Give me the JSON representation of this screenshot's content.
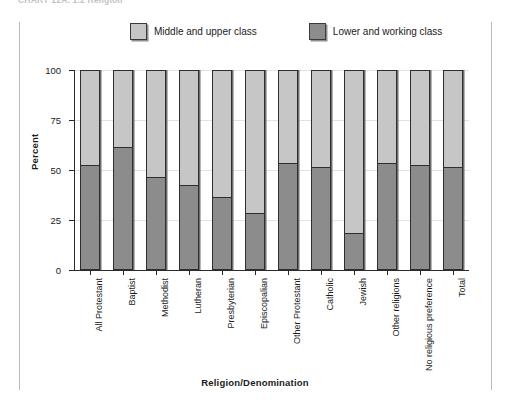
{
  "caption": "CHART 12A.  1.2  Religion",
  "legend": {
    "position": "top",
    "entries": [
      {
        "label": "Middle and upper class",
        "color": "#c6c6c6",
        "name": "upper"
      },
      {
        "label": "Lower and working class",
        "color": "#8c8c8c",
        "name": "lower"
      }
    ]
  },
  "axis": {
    "y_title": "Percent",
    "x_title": "Religion/Denomination",
    "y_ticks": [
      0,
      25,
      50,
      75,
      100
    ]
  },
  "chart_data": {
    "type": "bar",
    "subtype": "stacked-100-percent",
    "title": "CHART 12A.  1.2  Religion",
    "xlabel": "Religion/Denomination",
    "ylabel": "Percent",
    "ylim": [
      0,
      100
    ],
    "yticks": [
      0,
      25,
      50,
      75,
      100
    ],
    "grid": true,
    "legend_position": "top",
    "categories": [
      "All Protestant",
      "Baptist",
      "Methodist",
      "Lutheran",
      "Presbyterian",
      "Episcopalian",
      "Other Protestant",
      "Catholic",
      "Jewish",
      "Other religions",
      "No religious preference",
      "Total"
    ],
    "series": [
      {
        "name": "Lower and working class",
        "color": "#8c8c8c",
        "values": [
          52,
          61,
          46,
          42,
          36,
          28,
          53,
          51,
          18,
          53,
          52,
          51
        ]
      },
      {
        "name": "Middle and upper class",
        "color": "#c6c6c6",
        "values": [
          48,
          39,
          54,
          58,
          64,
          72,
          47,
          49,
          82,
          47,
          48,
          49
        ]
      }
    ]
  }
}
